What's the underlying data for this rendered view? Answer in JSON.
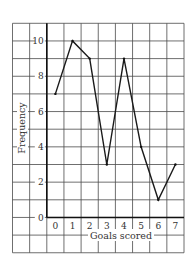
{
  "chart_data": {
    "type": "line",
    "title": "",
    "xlabel": "Goals scored",
    "ylabel": "Frequency",
    "categories": [
      "0",
      "1",
      "2",
      "3",
      "4",
      "5",
      "6",
      "7"
    ],
    "x": [
      0,
      1,
      2,
      3,
      4,
      5,
      6,
      7
    ],
    "values": [
      7,
      10,
      9,
      3,
      9,
      4,
      1,
      3
    ],
    "series": [
      {
        "name": "Frequency",
        "values": [
          7,
          10,
          9,
          3,
          9,
          4,
          1,
          3
        ]
      }
    ],
    "yticks": [
      "0",
      "2",
      "4",
      "6",
      "8",
      "10"
    ],
    "ylim": [
      0,
      11
    ],
    "grid": true,
    "legend": null
  },
  "colors": {
    "line": "#1a1a1a",
    "grid": "#4a4a4a",
    "text": "#333333"
  }
}
